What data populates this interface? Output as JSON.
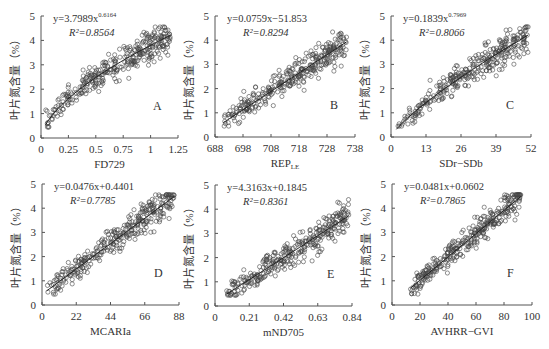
{
  "figure": {
    "background": "#ffffff",
    "point_color": "#444444",
    "line_color": "#222222",
    "ylabel": "叶片氮含量（%）"
  },
  "chart_data": [
    {
      "id": "A",
      "type": "scatter",
      "panel_letter": "A",
      "xlabel": "FD729",
      "xlabel_sub": "",
      "ylabel": "叶片氮含量（%）",
      "xticks": [
        "0",
        "0.25",
        "0.5",
        "0.75",
        "1",
        "1.25"
      ],
      "xlim": [
        0,
        1.25
      ],
      "yticks": [
        "0",
        "1",
        "2",
        "3",
        "4",
        "5"
      ],
      "ylim": [
        0,
        5
      ],
      "equation": "y=3.7989x",
      "equation_exponent": "0.6164",
      "r2_label": "R²=0.8564",
      "fit": {
        "form": "power",
        "a": 3.7989,
        "b": 0.6164
      },
      "x_data_range": [
        0.04,
        1.18
      ],
      "grid": false,
      "legend": "none"
    },
    {
      "id": "B",
      "type": "scatter",
      "panel_letter": "B",
      "xlabel": "REP",
      "xlabel_sub": "LE",
      "ylabel": "叶片氮含量（%）",
      "xticks": [
        "688",
        "698",
        "708",
        "718",
        "728",
        "738"
      ],
      "xlim": [
        688,
        738
      ],
      "yticks": [
        "0",
        "1",
        "2",
        "3",
        "4",
        "5"
      ],
      "ylim": [
        0,
        5
      ],
      "equation": "y=0.0759x−51.853",
      "equation_exponent": "",
      "r2_label": "R²=0.8294",
      "fit": {
        "form": "linear",
        "a": 0.0759,
        "b": -51.853
      },
      "x_data_range": [
        691,
        735
      ],
      "grid": false,
      "legend": "none"
    },
    {
      "id": "C",
      "type": "scatter",
      "panel_letter": "C",
      "xlabel": "SDr−SDb",
      "xlabel_sub": "",
      "ylabel": "叶片氮含量（%）",
      "xticks": [
        "0",
        "13",
        "26",
        "39",
        "52"
      ],
      "xlim": [
        0,
        52
      ],
      "yticks": [
        "0",
        "1",
        "2",
        "3",
        "4",
        "5"
      ],
      "ylim": [
        0,
        5
      ],
      "equation": "y=0.1839x",
      "equation_exponent": "0.7969",
      "r2_label": "R²=0.8066",
      "fit": {
        "form": "power",
        "a": 0.1839,
        "b": 0.7969
      },
      "x_data_range": [
        2,
        51
      ],
      "grid": false,
      "legend": "none"
    },
    {
      "id": "D",
      "type": "scatter",
      "panel_letter": "D",
      "xlabel": "MCARIa",
      "xlabel_sub": "",
      "ylabel": "叶片氮含量（%）",
      "xticks": [
        "0",
        "22",
        "44",
        "66",
        "88"
      ],
      "xlim": [
        0,
        88
      ],
      "yticks": [
        "0",
        "1",
        "2",
        "3",
        "4",
        "5"
      ],
      "ylim": [
        0,
        5
      ],
      "equation": "y=0.0476x+0.4401",
      "equation_exponent": "",
      "r2_label": "R²=0.7785",
      "fit": {
        "form": "linear",
        "a": 0.0476,
        "b": 0.4401
      },
      "x_data_range": [
        3,
        85
      ],
      "grid": false,
      "legend": "none"
    },
    {
      "id": "E",
      "type": "scatter",
      "panel_letter": "E",
      "xlabel": "mND705",
      "xlabel_sub": "",
      "ylabel": "叶片氮含量（%）",
      "xticks": [
        "0",
        "0.21",
        "0.42",
        "0.63",
        "0.84"
      ],
      "xlim": [
        0,
        0.84
      ],
      "yticks": [
        "0",
        "1",
        "2",
        "3",
        "4",
        "5"
      ],
      "ylim": [
        0,
        5
      ],
      "equation": "y=4.3163x+0.1845",
      "equation_exponent": "",
      "r2_label": "R²=0.8361",
      "fit": {
        "form": "linear",
        "a": 4.3163,
        "b": 0.1845
      },
      "x_data_range": [
        0.07,
        0.82
      ],
      "grid": false,
      "legend": "none"
    },
    {
      "id": "F",
      "type": "scatter",
      "panel_letter": "F",
      "xlabel": "AVHRR−GVI",
      "xlabel_sub": "",
      "ylabel": "叶片氮含量（%）",
      "xticks": [
        "0",
        "20",
        "40",
        "60",
        "80",
        "100"
      ],
      "xlim": [
        0,
        100
      ],
      "yticks": [
        "0",
        "1",
        "2",
        "3",
        "4",
        "5"
      ],
      "ylim": [
        0,
        5
      ],
      "equation": "y=0.0481x+0.0602",
      "equation_exponent": "",
      "r2_label": "R²=0.7865",
      "fit": {
        "form": "linear",
        "a": 0.0481,
        "b": 0.0602
      },
      "x_data_range": [
        13,
        92
      ],
      "grid": false,
      "legend": "none"
    }
  ]
}
